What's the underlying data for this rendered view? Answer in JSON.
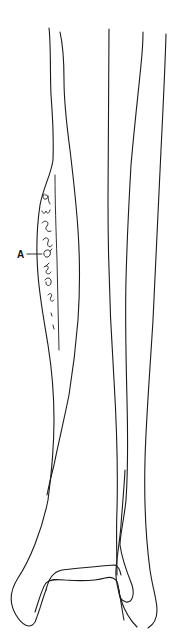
{
  "figure": {
    "stroke_color": "#1a1a1a",
    "background": "#ffffff",
    "labels": [
      {
        "id": "A",
        "text": "A",
        "x": 19,
        "y": 257,
        "pointer_to": [
          40,
          254
        ]
      }
    ]
  }
}
